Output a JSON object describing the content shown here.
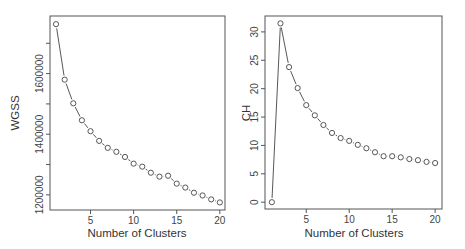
{
  "chart_data": [
    {
      "type": "line",
      "title": "",
      "xlabel": "Number of Clusters",
      "ylabel": "WGSS",
      "x": [
        1,
        2,
        3,
        4,
        5,
        6,
        7,
        8,
        9,
        10,
        11,
        12,
        13,
        14,
        15,
        16,
        17,
        18,
        19,
        20
      ],
      "values": [
        1763000,
        1580000,
        1502000,
        1446000,
        1410000,
        1378000,
        1355000,
        1342000,
        1325000,
        1303000,
        1293000,
        1273000,
        1260000,
        1263000,
        1237000,
        1224000,
        1207000,
        1198000,
        1185000,
        1175000
      ],
      "xticks": [
        5,
        10,
        15,
        20
      ],
      "yticks": [
        1200000,
        1300000,
        1400000,
        1500000,
        1600000,
        1700000
      ],
      "ytick_labels": [
        "1200000",
        "",
        "1400000",
        "",
        "1600000",
        ""
      ],
      "xlim": [
        0.3,
        20.6
      ],
      "ylim": [
        1150000,
        1790000
      ],
      "markers": "open-circle",
      "grid": false
    },
    {
      "type": "line",
      "title": "",
      "xlabel": "Number of Clusters",
      "ylabel": "CH",
      "x": [
        1,
        2,
        3,
        4,
        5,
        6,
        7,
        8,
        9,
        10,
        11,
        12,
        13,
        14,
        15,
        16,
        17,
        18,
        19,
        20
      ],
      "values": [
        0,
        31.5,
        23.8,
        20.1,
        17.1,
        15.3,
        13.6,
        12.2,
        11.3,
        10.8,
        10.1,
        9.5,
        8.8,
        8.1,
        8.1,
        7.9,
        7.6,
        7.4,
        7.1,
        6.9
      ],
      "xticks": [
        5,
        10,
        15,
        20
      ],
      "yticks": [
        0,
        5,
        10,
        15,
        20,
        25,
        30
      ],
      "ytick_labels": [
        "0",
        "5",
        "10",
        "15",
        "20",
        "25",
        "30"
      ],
      "xlim": [
        0.2,
        20.8
      ],
      "ylim": [
        -1.2,
        32.8
      ],
      "markers": "open-circle",
      "grid": false
    }
  ],
  "plots": {
    "left": {
      "xlabel": "Number of Clusters",
      "ylabel": "WGSS"
    },
    "right": {
      "xlabel": "Number of Clusters",
      "ylabel": "CH"
    }
  }
}
